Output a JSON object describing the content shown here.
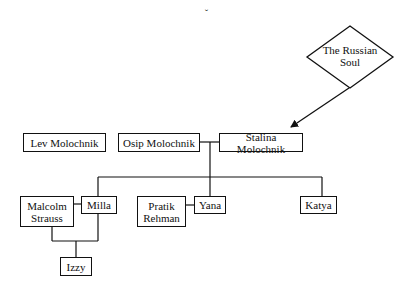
{
  "diagram": {
    "type": "family-tree",
    "top_mark": "ˇ",
    "concept": {
      "label": "The Russian Soul",
      "line1": "The Russian",
      "line2": "Soul",
      "shape": "diamond"
    },
    "people": {
      "lev": "Lev Molochnik",
      "osip": "Osip Molochnik",
      "stalina": "Stalina Molochnik",
      "malcolm": {
        "line1": "Malcolm",
        "line2": "Strauss"
      },
      "milla": "Milla",
      "pratik": {
        "line1": "Pratik",
        "line2": "Rehman"
      },
      "yana": "Yana",
      "katya": "Katya",
      "izzy": "Izzy"
    },
    "relations": [
      {
        "from": "The Russian Soul",
        "to": "Stalina Molochnik",
        "kind": "arrow"
      },
      {
        "a": "Osip Molochnik",
        "b": "Stalina Molochnik",
        "kind": "couple"
      },
      {
        "parents": [
          "Osip Molochnik",
          "Stalina Molochnik"
        ],
        "children": [
          "Milla",
          "Yana",
          "Katya"
        ]
      },
      {
        "a": "Malcolm Strauss",
        "b": "Milla",
        "kind": "couple"
      },
      {
        "a": "Pratik Rehman",
        "b": "Yana",
        "kind": "couple"
      },
      {
        "parents": [
          "Malcolm Strauss",
          "Milla"
        ],
        "children": [
          "Izzy"
        ]
      }
    ],
    "colors": {
      "line": "#111111",
      "background": "#ffffff"
    }
  }
}
